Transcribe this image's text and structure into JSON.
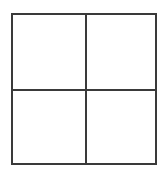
{
  "canvas": {
    "width": 166,
    "height": 176,
    "background_color": "#ffffff"
  },
  "figure": {
    "name": "four-quadrant-grid",
    "border_color": "#3a3a3a",
    "border_width_px": 2,
    "divider_color": "#3a3a3a",
    "divider_width_px": 2,
    "fill_color": "#ffffff",
    "outer_square": {
      "left": 11,
      "top": 13,
      "width": 146,
      "height": 152
    },
    "divider_vertical_x": 85,
    "divider_horizontal_y": 89,
    "rows": 2,
    "columns": 2,
    "cells": [
      {
        "position": "top-left",
        "label": ""
      },
      {
        "position": "top-right",
        "label": ""
      },
      {
        "position": "bottom-left",
        "label": ""
      },
      {
        "position": "bottom-right",
        "label": ""
      }
    ]
  }
}
